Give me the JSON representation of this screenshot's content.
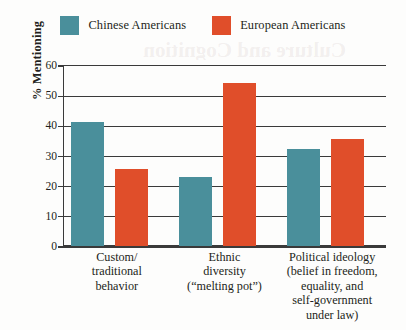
{
  "chart_data": {
    "type": "bar",
    "title": "",
    "xlabel": "",
    "ylabel": "% Mentioning",
    "ylim": [
      0,
      60
    ],
    "yticks": [
      0,
      10,
      20,
      30,
      40,
      50,
      60
    ],
    "ytick_labels": [
      "0",
      "10",
      "20",
      "30",
      "40",
      "50",
      "60"
    ],
    "grid": true,
    "legend_position": "top-center",
    "categories": [
      "Custom/\ntraditional\nbehavior",
      "Ethnic\ndiversity\n(“melting pot”)",
      "Political ideology\n(belief in freedom,\nequality, and\nself-government\nunder law)"
    ],
    "category_lines": [
      [
        "Custom/",
        "traditional",
        "behavior"
      ],
      [
        "Ethnic",
        "diversity",
        "(“melting pot”)"
      ],
      [
        "Political ideology",
        "(belief in freedom,",
        "equality, and",
        "self-government",
        "under law)"
      ]
    ],
    "series": [
      {
        "name": "Chinese Americans",
        "color": "#4a8f9b",
        "values": [
          41,
          23,
          32
        ]
      },
      {
        "name": "European Americans",
        "color": "#e04e2a",
        "values": [
          25.5,
          54,
          35.5
        ]
      }
    ]
  },
  "legend": {
    "entries": [
      {
        "label": "Chinese Americans",
        "color": "#4a8f9b"
      },
      {
        "label": "European Americans",
        "color": "#e04e2a"
      }
    ]
  },
  "axis": {
    "y_title": "% Mentioning"
  },
  "artifacts": {
    "page_bleed_text": "Culture and Cognition"
  }
}
